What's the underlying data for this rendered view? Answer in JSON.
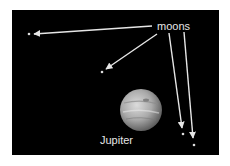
{
  "figure": {
    "labels": {
      "moons": "moons",
      "planet": "Jupiter"
    },
    "colors": {
      "background": "#000000",
      "text": "#e6e6e6",
      "arrow": "#e6e6e6",
      "moon": "#dddddd"
    },
    "moons": [
      {
        "x": 29,
        "y": 34
      },
      {
        "x": 102,
        "y": 72
      },
      {
        "x": 183,
        "y": 134
      },
      {
        "x": 194,
        "y": 145
      }
    ],
    "arrows": [
      {
        "x1": 152,
        "y1": 26,
        "x2": 34,
        "y2": 34
      },
      {
        "x1": 157,
        "y1": 34,
        "x2": 106,
        "y2": 69
      },
      {
        "x1": 169,
        "y1": 33,
        "x2": 182,
        "y2": 128
      },
      {
        "x1": 184,
        "y1": 32,
        "x2": 193,
        "y2": 138
      }
    ],
    "planet": {
      "cx": 141,
      "cy": 110,
      "r": 21
    }
  }
}
